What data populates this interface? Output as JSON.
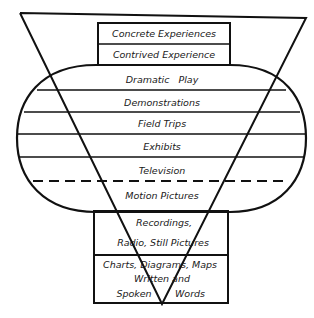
{
  "diagram": {
    "colors": {
      "ink": "#111111",
      "background": "#ffffff"
    },
    "top_box": [
      "Concrete Experiences",
      "Contrived Experience"
    ],
    "oval_bands": [
      "Dramatic   Play",
      "Demonstrations",
      "Field Trips",
      "Exhibits",
      "Television",
      "Motion Pictures"
    ],
    "bottom_box": {
      "recordings_line1": "Recordings,",
      "recordings_line2": "Radio, Still Pictures",
      "charts_line": "Charts, Diagrams, Maps",
      "written_line": "Written and",
      "spoken_left": "Spoken",
      "spoken_right": "Words"
    },
    "dashed_separator": "between Television and Motion Pictures"
  }
}
